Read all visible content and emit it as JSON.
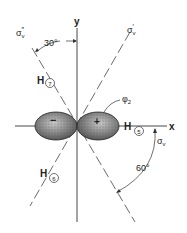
{
  "diagram": {
    "axes": {
      "x_label": "x",
      "y_label": "y"
    },
    "planes": {
      "sigma_v": "σ",
      "sigma_v_sub": "v",
      "sigma_v_prime": "σ",
      "sigma_v_prime_sub": "v",
      "sigma_v_prime_mark": "′",
      "sigma_v_dprime": "σ",
      "sigma_v_dprime_sub": "v",
      "sigma_v_dprime_mark": "″"
    },
    "angles": {
      "top": "30°",
      "bottom_right": "60°"
    },
    "orbital": {
      "label": "φ",
      "label_sub": "2",
      "left_sign": "−",
      "right_sign": "+"
    },
    "atoms": [
      {
        "symbol": "H",
        "number": "5"
      },
      {
        "symbol": "H",
        "number": "6"
      },
      {
        "symbol": "H",
        "number": "7"
      }
    ]
  }
}
